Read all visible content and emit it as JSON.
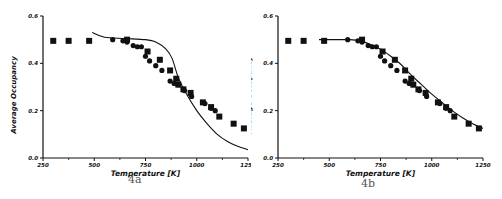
{
  "chart_data": [
    {
      "type": "scatter",
      "panel_label": "4a",
      "title": "",
      "xlabel": "Temperature  [K]",
      "ylabel": "Average Occupancy",
      "xlim": [
        250,
        1250
      ],
      "ylim": [
        0.0,
        0.6
      ],
      "xticks": [
        250,
        500,
        750,
        1000,
        1250
      ],
      "xtick_labels": [
        "250",
        "500",
        "750",
        "1000",
        "1250"
      ],
      "yticks": [
        0.0,
        0.2,
        0.4,
        0.6
      ],
      "ytick_labels": [
        "0.0",
        "0.2",
        "0.4",
        "0.6"
      ],
      "grid": false,
      "series": [
        {
          "name": "squares",
          "marker": "square",
          "x": [
            300,
            375,
            475,
            660,
            760,
            820,
            870,
            900,
            910,
            935,
            970,
            1030,
            1070,
            1110,
            1180,
            1230
          ],
          "y": [
            0.495,
            0.495,
            0.495,
            0.5,
            0.45,
            0.415,
            0.37,
            0.335,
            0.31,
            0.29,
            0.275,
            0.235,
            0.215,
            0.175,
            0.145,
            0.125
          ]
        },
        {
          "name": "circles",
          "marker": "circle",
          "x": [
            590,
            640,
            660,
            690,
            710,
            730,
            750,
            770,
            800,
            830,
            870,
            890,
            910,
            940,
            975,
            1040,
            1070,
            1090
          ],
          "y": [
            0.5,
            0.495,
            0.49,
            0.475,
            0.47,
            0.47,
            0.43,
            0.41,
            0.39,
            0.37,
            0.325,
            0.315,
            0.31,
            0.285,
            0.26,
            0.23,
            0.21,
            0.2
          ]
        },
        {
          "name": "model curve",
          "marker": "line",
          "x": [
            490,
            550,
            650,
            750,
            800,
            850,
            880,
            910,
            950,
            1000,
            1050,
            1100,
            1150,
            1200,
            1250
          ],
          "y": [
            0.53,
            0.51,
            0.505,
            0.5,
            0.49,
            0.46,
            0.42,
            0.34,
            0.27,
            0.2,
            0.145,
            0.1,
            0.07,
            0.05,
            0.035
          ]
        }
      ]
    },
    {
      "type": "scatter",
      "panel_label": "4b",
      "title": "",
      "xlabel": "Temperature  [K]",
      "ylabel": "Average Occupancy",
      "xlim": [
        250,
        1250
      ],
      "ylim": [
        0.0,
        0.6
      ],
      "xticks": [
        250,
        500,
        750,
        1000,
        1250
      ],
      "xtick_labels": [
        "250",
        "500",
        "750",
        "1000",
        "1250"
      ],
      "yticks": [
        0.0,
        0.2,
        0.4,
        0.6
      ],
      "ytick_labels": [
        "0.0",
        "0.2",
        "0.4",
        "0.6"
      ],
      "grid": false,
      "series": [
        {
          "name": "squares",
          "marker": "square",
          "x": [
            300,
            375,
            475,
            660,
            760,
            820,
            870,
            900,
            910,
            935,
            970,
            1030,
            1070,
            1110,
            1180,
            1230
          ],
          "y": [
            0.495,
            0.495,
            0.495,
            0.5,
            0.45,
            0.415,
            0.37,
            0.335,
            0.31,
            0.29,
            0.275,
            0.235,
            0.215,
            0.175,
            0.145,
            0.125
          ]
        },
        {
          "name": "circles",
          "marker": "circle",
          "x": [
            590,
            640,
            660,
            690,
            710,
            730,
            750,
            770,
            800,
            830,
            870,
            890,
            910,
            940,
            975,
            1040,
            1070,
            1090
          ],
          "y": [
            0.5,
            0.495,
            0.49,
            0.475,
            0.47,
            0.47,
            0.43,
            0.41,
            0.39,
            0.37,
            0.325,
            0.315,
            0.31,
            0.285,
            0.26,
            0.23,
            0.21,
            0.2
          ]
        },
        {
          "name": "model curve",
          "marker": "line",
          "x": [
            450,
            550,
            600,
            650,
            700,
            750,
            800,
            850,
            900,
            950,
            1000,
            1050,
            1100,
            1150,
            1200,
            1250
          ],
          "y": [
            0.5,
            0.5,
            0.5,
            0.495,
            0.48,
            0.46,
            0.43,
            0.395,
            0.35,
            0.31,
            0.27,
            0.235,
            0.2,
            0.17,
            0.145,
            0.125
          ]
        }
      ]
    }
  ]
}
